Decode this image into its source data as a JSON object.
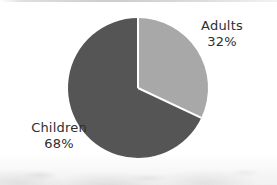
{
  "chart_data": {
    "type": "pie",
    "title": "",
    "subtitle": "",
    "xlabel": "",
    "ylabel": "",
    "legend_position": "none",
    "grid": false,
    "labels_outside": true,
    "categories": [
      "Adults",
      "Children"
    ],
    "values": [
      32,
      68
    ],
    "value_unit": "%",
    "start_angle_deg": 0,
    "direction": "clockwise",
    "slices": [
      {
        "label": "Adults",
        "value": 32,
        "value_label": "32%",
        "color": "#a8a8a8",
        "start_angle_deg": 0,
        "end_angle_deg": 115.2
      },
      {
        "label": "Children",
        "value": 68,
        "value_label": "68%",
        "color": "#555555",
        "start_angle_deg": 115.2,
        "end_angle_deg": 360
      }
    ],
    "annotations": []
  },
  "figure": {
    "background_color": "#ffffff",
    "pie": {
      "center_x": 138,
      "center_y": 88,
      "radius": 70,
      "separator_color": "#ffffff",
      "separator_width": 2
    }
  },
  "labels": {
    "adults": {
      "name": "Adults",
      "value": "32%"
    },
    "children": {
      "name": "Children",
      "value": "68%"
    }
  }
}
